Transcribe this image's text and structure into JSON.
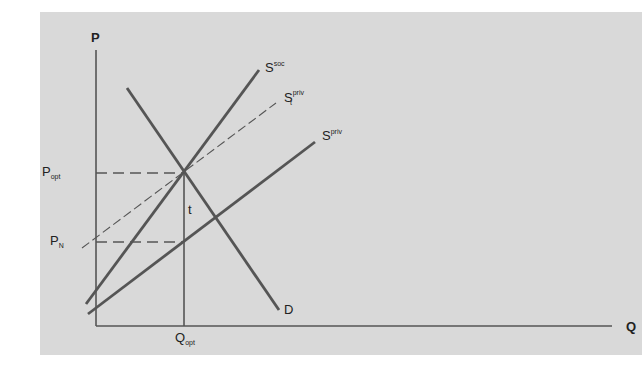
{
  "diagram": {
    "type": "supply-demand externality diagram",
    "axes": {
      "y_label": "P",
      "x_label": "Q"
    },
    "curves": [
      {
        "id": "s-soc",
        "label_main": "S",
        "label_sup": "soc",
        "label_sub": "",
        "style": "solid"
      },
      {
        "id": "s-t-priv",
        "label_main": "S",
        "label_sup": "priv",
        "label_sub": "t",
        "style": "dashed"
      },
      {
        "id": "s-priv",
        "label_main": "S",
        "label_sup": "priv",
        "label_sub": "",
        "style": "solid"
      },
      {
        "id": "demand",
        "label_main": "D",
        "label_sup": "",
        "label_sub": "",
        "style": "solid"
      }
    ],
    "price_levels": [
      {
        "id": "p-opt",
        "label_main": "P",
        "label_sub": "opt"
      },
      {
        "id": "p-n",
        "label_main": "P",
        "label_sub": "N"
      }
    ],
    "quantity_levels": [
      {
        "id": "q-opt",
        "label_main": "Q",
        "label_sub": "opt"
      }
    ],
    "tax_label": "t"
  },
  "colors": {
    "panel": "#d9d9d9",
    "line": "#555555",
    "text": "#222222"
  }
}
